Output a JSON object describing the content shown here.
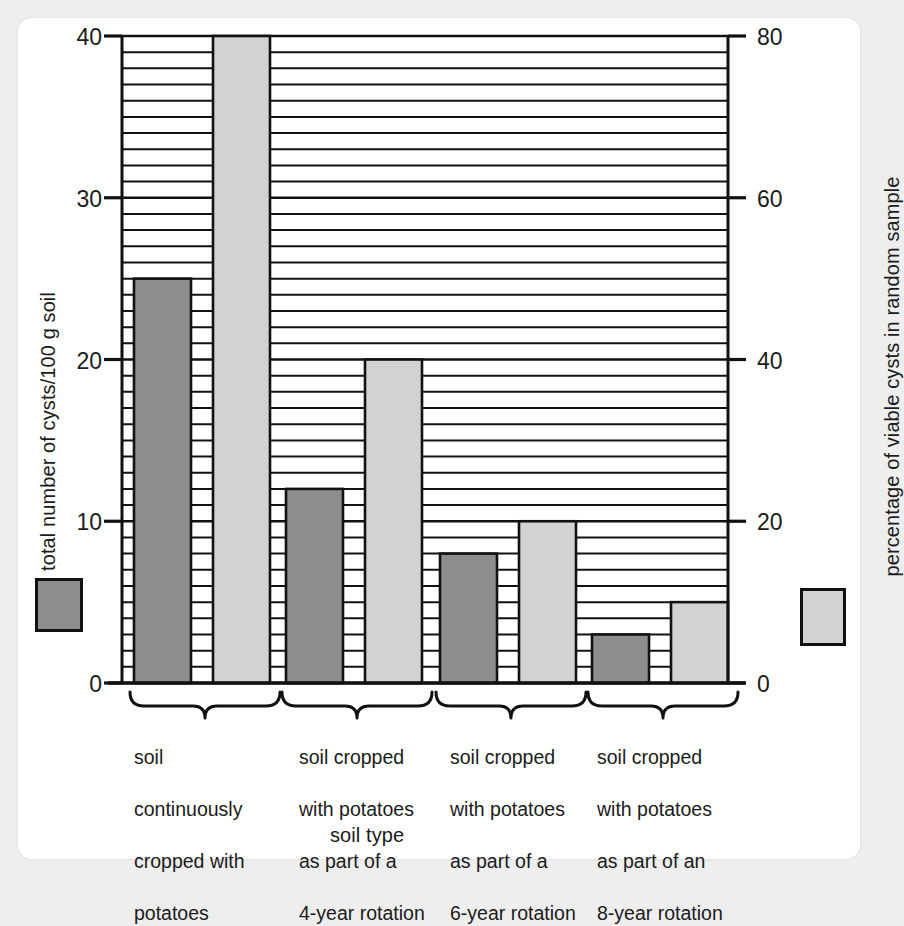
{
  "chart_data": {
    "type": "bar",
    "title": "",
    "xlabel": "soil type",
    "ylabel": "total number of cysts/100 g soil",
    "y2label": "percentage of viable cysts in random sample",
    "categories": [
      "soil continuously cropped with potatoes",
      "soil cropped with potatoes as part of a 4-year rotation",
      "soil cropped with potatoes as part of a 6-year rotation",
      "soil cropped with potatoes as part of an 8-year rotation"
    ],
    "category_lines": [
      [
        "soil",
        "continuously",
        "cropped with",
        "potatoes"
      ],
      [
        "soil cropped",
        "with potatoes",
        "as part of a",
        "4-year rotation"
      ],
      [
        "soil cropped",
        "with potatoes",
        "as part of a",
        "6-year rotation"
      ],
      [
        "soil cropped",
        "with potatoes",
        "as part of an",
        "8-year rotation"
      ]
    ],
    "series": [
      {
        "name": "total number of cysts/100 g soil",
        "axis": "left",
        "color": "#8d8d8d",
        "values": [
          25,
          12,
          8,
          3
        ]
      },
      {
        "name": "percentage of viable cysts in random sample",
        "axis": "right",
        "color": "#d2d2d2",
        "values": [
          80,
          40,
          20,
          10
        ]
      }
    ],
    "ylim": [
      0,
      40
    ],
    "y2lim": [
      0,
      80
    ],
    "yticks": [
      0,
      10,
      20,
      30,
      40
    ],
    "y2ticks": [
      0,
      20,
      40,
      60,
      80
    ],
    "grid": true,
    "grid_step": 1,
    "legend_position": "outside-left-and-right"
  },
  "axes": {
    "left_title": "total number of cysts/100 g soil",
    "right_title": "percentage of viable cysts in random sample",
    "x_title": "soil type",
    "left_ticks": [
      "40",
      "30",
      "20",
      "10",
      "0"
    ],
    "right_ticks": [
      "80",
      "60",
      "40",
      "20",
      "0"
    ]
  },
  "legend": {
    "left_swatch_color": "#8d8d8d",
    "right_swatch_color": "#d2d2d2"
  },
  "groups": [
    {
      "line1": "soil",
      "line2": "continuously",
      "line3": "cropped with",
      "line4": "potatoes"
    },
    {
      "line1": "soil cropped",
      "line2": "with potatoes",
      "line3": "as part of a",
      "line4": "4-year rotation"
    },
    {
      "line1": "soil cropped",
      "line2": "with potatoes",
      "line3": "as part of a",
      "line4": "6-year rotation"
    },
    {
      "line1": "soil cropped",
      "line2": "with potatoes",
      "line3": "as part of an",
      "line4": "8-year rotation"
    }
  ],
  "colors": {
    "dark_bar": "#8d8d8d",
    "light_bar": "#d2d2d2",
    "axis": "#111111",
    "grid": "#111111",
    "card": "#ffffff",
    "page_background": "#eeeeee"
  }
}
